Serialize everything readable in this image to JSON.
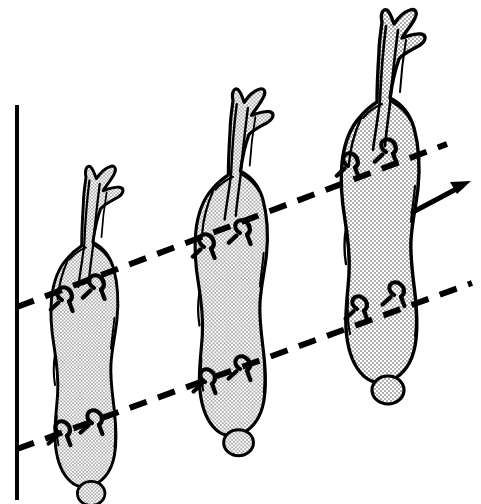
{
  "figure": {
    "kind": "scientific-line-diagram",
    "title": "",
    "caption": "",
    "background_color": "#ffffff",
    "ink_color": "#000000",
    "stipple_fill_color": "#000000",
    "stipple_background": "#ffffff",
    "canvas": {
      "width": 481,
      "height": 504
    }
  },
  "reference_axis": {
    "name": "vertical-reference-line",
    "style": "solid",
    "color": "#000000",
    "stroke_width": 4,
    "x": 17,
    "y_top": 105,
    "y_bottom": 500
  },
  "guide_lines": [
    {
      "name": "upper-dashed-guide-line",
      "style": "dashed",
      "color": "#000000",
      "stroke_width": 6,
      "dash": "18 12",
      "x1": 17,
      "y1": 307,
      "x2": 447,
      "y2": 144
    },
    {
      "name": "lower-dashed-guide-line",
      "style": "dashed",
      "color": "#000000",
      "stroke_width": 6,
      "dash": "18 12",
      "x1": 17,
      "y1": 449,
      "x2": 472,
      "y2": 283
    }
  ],
  "direction_arrow": {
    "name": "direction-arrow",
    "color": "#000000",
    "x1": 413,
    "y1": 212,
    "x2": 470,
    "y2": 182,
    "label": ""
  },
  "specimens": [
    {
      "id": "specimen-1",
      "label": "",
      "position": "left",
      "translate_x": 0,
      "translate_y": 158,
      "scale": 0.86,
      "basal_knob": true,
      "hook_marks_upper": 2,
      "hook_marks_lower": 2
    },
    {
      "id": "specimen-2",
      "label": "",
      "position": "middle",
      "translate_x": 140,
      "translate_y": 80,
      "scale": 0.93,
      "basal_knob": true,
      "hook_marks_upper": 2,
      "hook_marks_lower": 2
    },
    {
      "id": "specimen-3",
      "label": "",
      "position": "right",
      "translate_x": 282,
      "translate_y": 0,
      "scale": 1.0,
      "basal_knob": true,
      "hook_marks_upper": 2,
      "hook_marks_lower": 2
    }
  ]
}
